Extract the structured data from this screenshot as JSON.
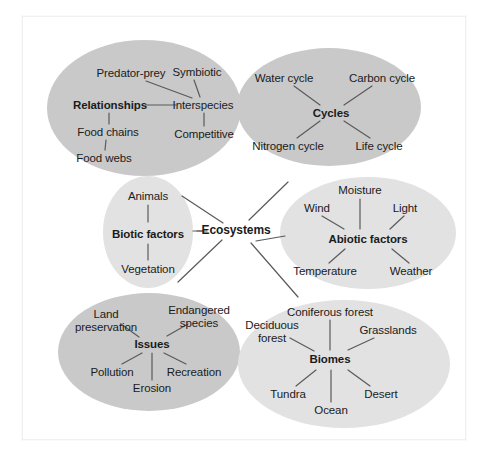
{
  "diagram": {
    "type": "concept-map",
    "center": {
      "label": "Ecosystems",
      "x": 236,
      "y": 230
    },
    "colors": {
      "cluster_dark": "#c9c9c9",
      "cluster_light": "#e2e2e2",
      "background": "#ffffff",
      "frame_border": "#f0f0f0",
      "line": "#5a5a5a",
      "text": "#1b1b1b"
    },
    "clusters": [
      {
        "id": "relationships",
        "hub": "Relationships",
        "shade": "dark",
        "ellipse": {
          "cx": 144,
          "cy": 108,
          "rx": 97,
          "ry": 68
        },
        "hub_pos": {
          "x": 110,
          "y": 105
        },
        "nodes": [
          {
            "label": "Predator-prey",
            "x": 131,
            "y": 73
          },
          {
            "label": "Symbiotic",
            "x": 197,
            "y": 72
          },
          {
            "label": "Interspecies",
            "x": 203,
            "y": 105
          },
          {
            "label": "Competitive",
            "x": 204,
            "y": 134
          },
          {
            "label": "Food chains",
            "x": 108,
            "y": 132
          },
          {
            "label": "Food webs",
            "x": 104,
            "y": 158
          }
        ]
      },
      {
        "id": "cycles",
        "hub": "Cycles",
        "shade": "dark",
        "ellipse": {
          "cx": 329,
          "cy": 107,
          "rx": 92,
          "ry": 59
        },
        "hub_pos": {
          "x": 331,
          "y": 113
        },
        "nodes": [
          {
            "label": "Water cycle",
            "x": 284,
            "y": 78
          },
          {
            "label": "Carbon cycle",
            "x": 382,
            "y": 78
          },
          {
            "label": "Nitrogen cycle",
            "x": 288,
            "y": 146
          },
          {
            "label": "Life cycle",
            "x": 379,
            "y": 146
          }
        ]
      },
      {
        "id": "biotic",
        "hub": "Biotic factors",
        "shade": "light",
        "ellipse": {
          "cx": 148,
          "cy": 232,
          "rx": 45,
          "ry": 56
        },
        "hub_pos": {
          "x": 148,
          "y": 234
        },
        "nodes": [
          {
            "label": "Animals",
            "x": 148,
            "y": 196
          },
          {
            "label": "Vegetation",
            "x": 148,
            "y": 269
          }
        ]
      },
      {
        "id": "abiotic",
        "hub": "Abiotic factors",
        "shade": "light",
        "ellipse": {
          "cx": 368,
          "cy": 233,
          "rx": 88,
          "ry": 56
        },
        "hub_pos": {
          "x": 368,
          "y": 239
        },
        "nodes": [
          {
            "label": "Moisture",
            "x": 360,
            "y": 190
          },
          {
            "label": "Wind",
            "x": 317,
            "y": 208
          },
          {
            "label": "Light",
            "x": 405,
            "y": 208
          },
          {
            "label": "Temperature",
            "x": 325,
            "y": 271
          },
          {
            "label": "Weather",
            "x": 411,
            "y": 271
          }
        ]
      },
      {
        "id": "issues",
        "hub": "Issues",
        "shade": "dark",
        "ellipse": {
          "cx": 149,
          "cy": 352,
          "rx": 91,
          "ry": 59
        },
        "hub_pos": {
          "x": 152,
          "y": 344
        },
        "nodes": [
          {
            "label": "Land\npreservation",
            "x": 106,
            "y": 320
          },
          {
            "label": "Endangered\nspecies",
            "x": 199,
            "y": 316
          },
          {
            "label": "Pollution",
            "x": 112,
            "y": 372
          },
          {
            "label": "Erosion",
            "x": 152,
            "y": 388
          },
          {
            "label": "Recreation",
            "x": 194,
            "y": 372
          }
        ]
      },
      {
        "id": "biomes",
        "hub": "Biomes",
        "shade": "light",
        "ellipse": {
          "cx": 344,
          "cy": 364,
          "rx": 106,
          "ry": 64
        },
        "hub_pos": {
          "x": 330,
          "y": 359
        },
        "nodes": [
          {
            "label": "Coniferous forest",
            "x": 330,
            "y": 312
          },
          {
            "label": "Deciduous\nforest",
            "x": 272,
            "y": 331
          },
          {
            "label": "Grasslands",
            "x": 388,
            "y": 330
          },
          {
            "label": "Tundra",
            "x": 288,
            "y": 394
          },
          {
            "label": "Ocean",
            "x": 331,
            "y": 410
          },
          {
            "label": "Desert",
            "x": 381,
            "y": 394
          }
        ]
      }
    ],
    "edges": [
      {
        "from": "Ecosystems",
        "to": "Relationships",
        "x1": 223,
        "y1": 223,
        "x2": 182,
        "y2": 196
      },
      {
        "from": "Ecosystems",
        "to": "Cycles",
        "x1": 249,
        "y1": 220,
        "x2": 288,
        "y2": 182
      },
      {
        "from": "Ecosystems",
        "to": "Biotic factors",
        "x1": 203,
        "y1": 231,
        "x2": 193,
        "y2": 231
      },
      {
        "from": "Ecosystems",
        "to": "Abiotic factors",
        "x1": 256,
        "y1": 241,
        "x2": 285,
        "y2": 236
      },
      {
        "from": "Ecosystems",
        "to": "Issues",
        "x1": 222,
        "y1": 240,
        "x2": 178,
        "y2": 282
      },
      {
        "from": "Ecosystems",
        "to": "Biomes",
        "x1": 251,
        "y1": 243,
        "x2": 298,
        "y2": 297
      },
      {
        "from": "Relationships",
        "to": "Interspecies",
        "x1": 146,
        "y1": 105,
        "x2": 176,
        "y2": 105
      },
      {
        "from": "Interspecies",
        "to": "Predator-prey",
        "x1": 192,
        "y1": 98,
        "x2": 146,
        "y2": 81
      },
      {
        "from": "Interspecies",
        "to": "Symbiotic",
        "x1": 200,
        "y1": 97,
        "x2": 194,
        "y2": 80
      },
      {
        "from": "Interspecies",
        "to": "Competitive",
        "x1": 204,
        "y1": 113,
        "x2": 204,
        "y2": 126
      },
      {
        "from": "Relationships",
        "to": "Food chains",
        "x1": 109,
        "y1": 113,
        "x2": 109,
        "y2": 124
      },
      {
        "from": "Food chains",
        "to": "Food webs",
        "x1": 106,
        "y1": 140,
        "x2": 105,
        "y2": 150
      },
      {
        "from": "Cycles",
        "to": "Water cycle",
        "x1": 320,
        "y1": 105,
        "x2": 294,
        "y2": 86
      },
      {
        "from": "Cycles",
        "to": "Carbon cycle",
        "x1": 344,
        "y1": 105,
        "x2": 372,
        "y2": 86
      },
      {
        "from": "Cycles",
        "to": "Nitrogen cycle",
        "x1": 320,
        "y1": 121,
        "x2": 297,
        "y2": 138
      },
      {
        "from": "Cycles",
        "to": "Life cycle",
        "x1": 344,
        "y1": 121,
        "x2": 370,
        "y2": 138
      },
      {
        "from": "Biotic factors",
        "to": "Animals",
        "x1": 148,
        "y1": 222,
        "x2": 148,
        "y2": 205
      },
      {
        "from": "Biotic factors",
        "to": "Vegetation",
        "x1": 148,
        "y1": 244,
        "x2": 148,
        "y2": 260
      },
      {
        "from": "Abiotic factors",
        "to": "Moisture",
        "x1": 360,
        "y1": 229,
        "x2": 360,
        "y2": 199
      },
      {
        "from": "Abiotic factors",
        "to": "Wind",
        "x1": 344,
        "y1": 229,
        "x2": 322,
        "y2": 216
      },
      {
        "from": "Abiotic factors",
        "to": "Light",
        "x1": 390,
        "y1": 229,
        "x2": 404,
        "y2": 216
      },
      {
        "from": "Abiotic factors",
        "to": "Temperature",
        "x1": 345,
        "y1": 249,
        "x2": 329,
        "y2": 263
      },
      {
        "from": "Abiotic factors",
        "to": "Weather",
        "x1": 392,
        "y1": 249,
        "x2": 409,
        "y2": 263
      },
      {
        "from": "Issues",
        "to": "Land preservation",
        "x1": 139,
        "y1": 337,
        "x2": 121,
        "y2": 324
      },
      {
        "from": "Issues",
        "to": "Endangered species",
        "x1": 167,
        "y1": 336,
        "x2": 188,
        "y2": 324
      },
      {
        "from": "Issues",
        "to": "Pollution",
        "x1": 142,
        "y1": 353,
        "x2": 122,
        "y2": 364
      },
      {
        "from": "Issues",
        "to": "Erosion",
        "x1": 152,
        "y1": 353,
        "x2": 152,
        "y2": 380
      },
      {
        "from": "Issues",
        "to": "Recreation",
        "x1": 164,
        "y1": 353,
        "x2": 186,
        "y2": 364
      },
      {
        "from": "Biomes",
        "to": "Coniferous forest",
        "x1": 330,
        "y1": 350,
        "x2": 330,
        "y2": 320
      },
      {
        "from": "Biomes",
        "to": "Deciduous forest",
        "x1": 314,
        "y1": 351,
        "x2": 290,
        "y2": 338
      },
      {
        "from": "Biomes",
        "to": "Grasslands",
        "x1": 348,
        "y1": 350,
        "x2": 374,
        "y2": 338
      },
      {
        "from": "Biomes",
        "to": "Tundra",
        "x1": 316,
        "y1": 370,
        "x2": 296,
        "y2": 386
      },
      {
        "from": "Biomes",
        "to": "Ocean",
        "x1": 331,
        "y1": 370,
        "x2": 331,
        "y2": 402
      },
      {
        "from": "Biomes",
        "to": "Desert",
        "x1": 348,
        "y1": 370,
        "x2": 370,
        "y2": 386
      },
      {
        "from": "Ecosystems",
        "to": "Ecosystems-stub-left",
        "x1": 197,
        "y1": 231,
        "x2": 207,
        "y2": 231
      }
    ]
  }
}
